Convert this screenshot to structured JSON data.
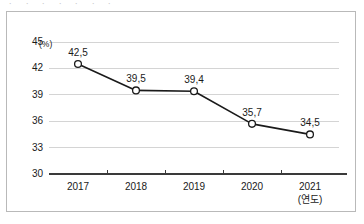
{
  "figure": {
    "cut_off_header_text": "ㆍ ㆍ  ㆍ ㆍ  ㆍ  ㆍ ㆍ"
  },
  "chart_data": {
    "type": "line",
    "title": "",
    "subtitle": "",
    "xlabel": "(연도)",
    "ylabel": "(%)",
    "categories": [
      "2017",
      "2018",
      "2019",
      "2020",
      "2021"
    ],
    "values": [
      42.5,
      39.5,
      39.4,
      35.7,
      34.5
    ],
    "point_labels": [
      "42,5",
      "39,5",
      "39,4",
      "35,7",
      "34,5"
    ],
    "ylim": [
      30,
      45
    ],
    "yticks": [
      45,
      42,
      39,
      36,
      33,
      30
    ],
    "ytick_labels": [
      "45",
      "42",
      "39",
      "36",
      "33",
      "30"
    ],
    "grid": true,
    "legend": "none",
    "series": [
      {
        "name": "",
        "values": [
          42.5,
          39.5,
          39.4,
          35.7,
          34.5
        ],
        "line_color": "#1a1a1a",
        "marker": "open-circle",
        "marker_fill": "#ffffff"
      }
    ],
    "colors": {
      "line": "#1a1a1a",
      "grid": "#d4d4d4",
      "axis": "#3a3a3a",
      "border": "#b9b9b9",
      "text": "#1a1a1a"
    }
  }
}
